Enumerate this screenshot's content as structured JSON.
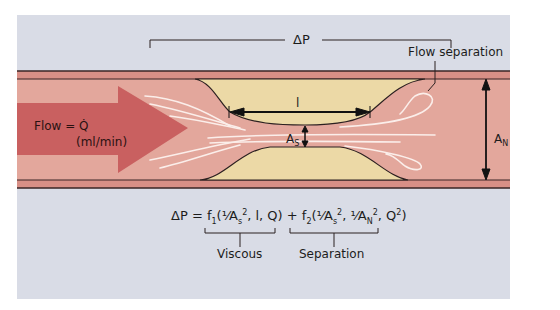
{
  "diagram": {
    "type": "stenosis-flow-schematic",
    "labels": {
      "delta_p": "ΔP",
      "flow_separation": "Flow separation",
      "flow_line1": "Flow = Q̇",
      "flow_line2": "(ml/min)",
      "length": "l",
      "stenosis_area": "A",
      "stenosis_area_sub": "S",
      "normal_area": "A",
      "normal_area_sub": "N"
    },
    "equation": {
      "lhs": "ΔP",
      "equals": "=",
      "f1": "f",
      "f1_sub": "1",
      "f1_args": "(¹⁄A",
      "f1_args_sub": "s",
      "f1_args_sup": "2",
      "f1_args_rest": ", l, Q)",
      "plus": "+",
      "f2": "f",
      "f2_sub": "2",
      "f2_args": "(¹⁄A",
      "f2_args_sub": "s",
      "f2_args_sup": "2",
      "f2_args_mid": ", ¹⁄A",
      "f2_args_mid_sub": "N",
      "f2_args_mid_sup": "2",
      "f2_args_rest": ", Q",
      "f2_args_rest_sup": "2",
      "f2_close": ")"
    },
    "brackets": {
      "viscous": "Viscous",
      "separation": "Separation"
    },
    "colors": {
      "background": "#d9dce6",
      "vessel_wall": "#d88f86",
      "lumen": "#e3a79c",
      "arrow": "#c5595a",
      "plaque": "#ecd9a6",
      "outline": "#2b2020",
      "streamline": "#fbeeea"
    }
  }
}
